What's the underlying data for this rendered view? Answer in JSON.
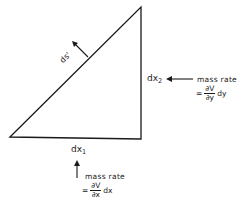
{
  "diagram": {
    "type": "right-triangle control volume",
    "edges": {
      "hypotenuse": {
        "label": "ds'",
        "has_normal_arrow": true
      },
      "vertical_side": {
        "label_main": "dx",
        "label_sub": "2"
      },
      "bottom_side": {
        "label_main": "dx",
        "label_sub": "1"
      }
    },
    "right_flow": {
      "title": "mass rate",
      "equals": "=",
      "numerator": "∂V",
      "denominator": "∂y",
      "factor": "dy"
    },
    "bottom_flow": {
      "title": "mass rate",
      "equals": "=",
      "numerator": "∂V",
      "denominator": "∂x",
      "factor": "dx"
    },
    "colors": {
      "stroke": "#1a1a1a",
      "background": "#ffffff"
    }
  }
}
